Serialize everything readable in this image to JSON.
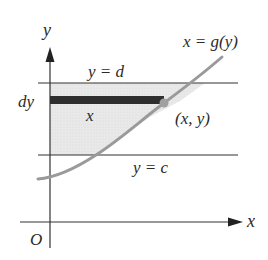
{
  "figure": {
    "axes": {
      "x_label": "x",
      "y_label": "y",
      "origin_label": "O"
    },
    "lines": {
      "upper": {
        "label": "y = d"
      },
      "lower": {
        "label": "y = c"
      }
    },
    "curve": {
      "label": "x = g(y)"
    },
    "strip": {
      "thickness_label": "dy",
      "length_label": "x"
    },
    "point": {
      "label": "(x, y)"
    },
    "colors": {
      "axis": "#333333",
      "curve": "#9a9a9a",
      "region_fill": "#e6e6e6",
      "strip": "#2e2e2e",
      "point": "#a0a0a0"
    }
  }
}
